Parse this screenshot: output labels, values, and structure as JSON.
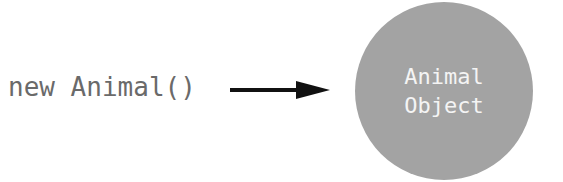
{
  "diagram": {
    "source_label": "new Animal()",
    "arrow": {
      "direction": "right",
      "color": "#111111"
    },
    "target": {
      "shape": "circle",
      "fill": "#a3a3a3",
      "lines": [
        "Animal",
        "Object"
      ]
    }
  }
}
